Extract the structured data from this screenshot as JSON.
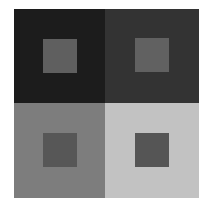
{
  "diagram": {
    "type": "simultaneous-contrast-illusion",
    "background": "#ffffff",
    "quadrants": [
      {
        "position": "top-left",
        "outer_color": "#1c1c1c",
        "inner_color": "#5f5f5f"
      },
      {
        "position": "top-right",
        "outer_color": "#333333",
        "inner_color": "#616161"
      },
      {
        "position": "bottom-left",
        "outer_color": "#7d7d7d",
        "inner_color": "#575757"
      },
      {
        "position": "bottom-right",
        "outer_color": "#c2c2c2",
        "inner_color": "#555555"
      }
    ]
  }
}
